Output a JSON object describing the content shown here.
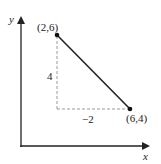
{
  "diagram": {
    "axes": {
      "x_label": "x",
      "y_label": "y"
    },
    "points": [
      {
        "label": "(2,6)",
        "x": 2,
        "y": 6
      },
      {
        "label": "(6,4)",
        "x": 6,
        "y": 4
      }
    ],
    "rise_label": "4",
    "run_label": "−2",
    "colors": {
      "line": "#222222",
      "dashed": "#999999",
      "axes": "#222222"
    }
  }
}
